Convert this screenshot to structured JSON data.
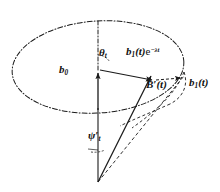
{
  "figure": {
    "name": "precession-cone-vector-diagram",
    "background_color": "#ffffff",
    "stroke_color": "#1a1a1a",
    "labels": {
      "theta": {
        "symbol": "θ",
        "subscript": "t",
        "prime": ""
      },
      "b0": {
        "symbol": "b",
        "subscript": "0",
        "prime": ""
      },
      "b1_decay": {
        "symbol": "b",
        "subscript": "1",
        "arg": "(t)",
        "factor_base": "e",
        "factor_exponent": "−λt"
      },
      "B_prime": {
        "symbol": "B",
        "prime": "′",
        "arg": "(t)"
      },
      "b1_t": {
        "symbol": "b",
        "subscript": "1",
        "arg": "(t)"
      },
      "psi": {
        "symbol": "ψ",
        "prime": "′",
        "subscript": "t"
      }
    },
    "elements": {
      "big_ellipse": "precession-circle-dash-dot",
      "small_ellipse_arc": "tip-trajectory-arc-dashed",
      "axis_line": "vertical-dash-dot-axis",
      "b0_vector": "b0-arrow-up",
      "b1_decay_vector": "b1-decay-arrow",
      "B_prime_vector": "B-prime-arrow",
      "b1_vector": "b1-arrow",
      "cone_edge_solid": "cone-edge-solid-line",
      "cone_edge_dashed": "cone-edge-dashed-line",
      "psi_arc": "psi-angle-arc",
      "theta_arc": "theta-angle-arc"
    }
  }
}
